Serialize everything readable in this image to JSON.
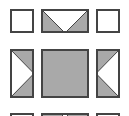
{
  "diagram": {
    "colors": {
      "background": "#ffffff",
      "fill": "#a9a9a9",
      "border": "#444444",
      "light": "#ffffff"
    },
    "tiles": [
      {
        "id": "r1c1",
        "shape": "plain-square",
        "x": 10,
        "y": 9,
        "w": 24,
        "h": 24
      },
      {
        "id": "r1c2",
        "shape": "goose-down",
        "x": 41,
        "y": 9,
        "w": 48,
        "h": 24
      },
      {
        "id": "r1c3",
        "shape": "plain-square",
        "x": 96,
        "y": 9,
        "w": 24,
        "h": 24
      },
      {
        "id": "r2c1",
        "shape": "goose-right",
        "x": 10,
        "y": 49,
        "w": 24,
        "h": 49
      },
      {
        "id": "r2c2",
        "shape": "solid-square",
        "x": 41,
        "y": 49,
        "w": 48,
        "h": 49
      },
      {
        "id": "r2c3",
        "shape": "goose-left",
        "x": 96,
        "y": 49,
        "w": 24,
        "h": 49
      },
      {
        "id": "r3c1",
        "shape": "plain-square",
        "x": 10,
        "y": 113,
        "w": 24,
        "h": 24
      },
      {
        "id": "r3c2",
        "shape": "goose-up",
        "x": 41,
        "y": 113,
        "w": 48,
        "h": 24
      },
      {
        "id": "r3c3",
        "shape": "plain-square",
        "x": 96,
        "y": 113,
        "w": 24,
        "h": 24
      }
    ]
  }
}
